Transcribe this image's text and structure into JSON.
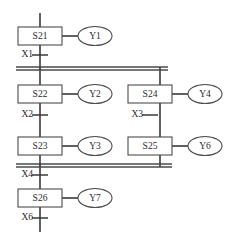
{
  "diagram": {
    "type": "sequential-function-chart",
    "title": "",
    "colors": {
      "line": "#3a3a3a",
      "box_stroke": "#4d4d4d",
      "box_fill": "#ffffff",
      "text": "#2b2b2b",
      "background": "#ffffff"
    },
    "steps": [
      {
        "id": "s21",
        "label": "S21",
        "x": 40,
        "y": 36,
        "w": 44,
        "h": 18
      },
      {
        "id": "s22",
        "label": "S22",
        "x": 40,
        "y": 94,
        "w": 44,
        "h": 18
      },
      {
        "id": "s23",
        "label": "S23",
        "x": 40,
        "y": 146,
        "w": 44,
        "h": 18
      },
      {
        "id": "s24",
        "label": "S24",
        "x": 150,
        "y": 94,
        "w": 44,
        "h": 18
      },
      {
        "id": "s25",
        "label": "S25",
        "x": 150,
        "y": 146,
        "w": 44,
        "h": 18
      },
      {
        "id": "s26",
        "label": "S26",
        "x": 40,
        "y": 198,
        "w": 44,
        "h": 18
      }
    ],
    "actions": [
      {
        "id": "y1",
        "label": "Y1",
        "step": "S21",
        "cx": 95,
        "cy": 36,
        "rx": 17,
        "ry": 9.5
      },
      {
        "id": "y2",
        "label": "Y2",
        "step": "S22",
        "cx": 95,
        "cy": 94,
        "rx": 17,
        "ry": 9.5
      },
      {
        "id": "y3",
        "label": "Y3",
        "step": "S23",
        "cx": 95,
        "cy": 146,
        "rx": 17,
        "ry": 9.5
      },
      {
        "id": "y4",
        "label": "Y4",
        "step": "S24",
        "cx": 205,
        "cy": 94,
        "rx": 17,
        "ry": 9.5
      },
      {
        "id": "y6",
        "label": "Y6",
        "step": "S25",
        "cx": 205,
        "cy": 146,
        "rx": 17,
        "ry": 9.5
      },
      {
        "id": "y7",
        "label": "Y7",
        "step": "S26",
        "cx": 95,
        "cy": 198,
        "rx": 17,
        "ry": 9.5
      }
    ],
    "transitions": [
      {
        "id": "x1",
        "label": "X1",
        "cx": 40,
        "cy": 55,
        "text_x": 33,
        "text_y": 55
      },
      {
        "id": "x2",
        "label": "X2",
        "cx": 40,
        "cy": 115,
        "text_x": 33,
        "text_y": 115
      },
      {
        "id": "x3",
        "label": "X3",
        "cx": 150,
        "cy": 115,
        "text_x": 143,
        "text_y": 115
      },
      {
        "id": "x4",
        "label": "X4",
        "cx": 40,
        "cy": 175,
        "text_x": 33,
        "text_y": 175
      },
      {
        "id": "x6",
        "label": "X6",
        "cx": 40,
        "cy": 218,
        "text_x": 33,
        "text_y": 218
      }
    ],
    "parallel_bars": [
      {
        "id": "divergence",
        "x1": 16,
        "x2": 168,
        "y": 67,
        "gap": 3.0
      },
      {
        "id": "convergence",
        "x1": 16,
        "x2": 172,
        "y": 164,
        "gap": 3.0
      }
    ],
    "wires": [
      {
        "id": "top-entry",
        "x1": 40,
        "y1": 13,
        "x2": 40,
        "y2": 27
      },
      {
        "id": "s21-to-x1",
        "x1": 40,
        "y1": 45,
        "x2": 40,
        "y2": 70
      },
      {
        "id": "left-branch-down",
        "x1": 40,
        "y1": 67,
        "x2": 40,
        "y2": 85
      },
      {
        "id": "s22-to-s23",
        "x1": 40,
        "y1": 103,
        "x2": 40,
        "y2": 137
      },
      {
        "id": "s23-to-bar",
        "x1": 40,
        "y1": 155,
        "x2": 40,
        "y2": 167
      },
      {
        "id": "bar-to-s26",
        "x1": 40,
        "y1": 164,
        "x2": 40,
        "y2": 189
      },
      {
        "id": "s26-to-exit",
        "x1": 40,
        "y1": 207,
        "x2": 40,
        "y2": 232
      },
      {
        "id": "right-branch-down",
        "x1": 160,
        "y1": 67,
        "x2": 160,
        "y2": 85
      },
      {
        "id": "s24-to-s25",
        "x1": 160,
        "y1": 103,
        "x2": 160,
        "y2": 137
      },
      {
        "id": "s25-to-bar",
        "x1": 160,
        "y1": 155,
        "x2": 160,
        "y2": 167
      },
      {
        "id": "s21-action-link",
        "x1": 62,
        "y1": 36,
        "x2": 78,
        "y2": 36
      },
      {
        "id": "s22-action-link",
        "x1": 62,
        "y1": 94,
        "x2": 78,
        "y2": 94
      },
      {
        "id": "s23-action-link",
        "x1": 62,
        "y1": 146,
        "x2": 78,
        "y2": 146
      },
      {
        "id": "s24-action-link",
        "x1": 172,
        "y1": 94,
        "x2": 188,
        "y2": 94
      },
      {
        "id": "s25-action-link",
        "x1": 172,
        "y1": 146,
        "x2": 188,
        "y2": 146
      },
      {
        "id": "s26-action-link",
        "x1": 62,
        "y1": 198,
        "x2": 78,
        "y2": 198
      }
    ]
  }
}
